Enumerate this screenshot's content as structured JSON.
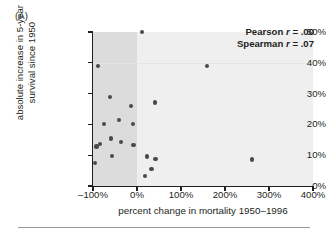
{
  "panel": {
    "label": "(A)"
  },
  "chart_data": {
    "type": "scatter",
    "title": "",
    "xlabel": "percent change in mortality 1950–1996",
    "ylabel": "absolute increase in 5-year survival since 1950",
    "xlim": [
      -100,
      400
    ],
    "ylim": [
      0,
      50
    ],
    "xticks": [
      -100,
      0,
      100,
      200,
      300,
      400
    ],
    "xtick_labels": [
      "–100%",
      "0%",
      "100%",
      "200%",
      "300%",
      "400%"
    ],
    "yticks": [
      0,
      10,
      20,
      30,
      40,
      50
    ],
    "ytick_labels": [
      "0%",
      "10%",
      "20%",
      "30%",
      "40%",
      "50%"
    ],
    "grid": false,
    "legend": "none",
    "shaded_region": {
      "from": -100,
      "to": 0,
      "color": "#dcdcdd"
    },
    "plot_background": "#efeff0",
    "marker_color": "#4a4a4c",
    "points": [
      {
        "x": -88,
        "y": 39.0
      },
      {
        "x": -92,
        "y": 12.8
      },
      {
        "x": -96,
        "y": 7.5
      },
      {
        "x": -85,
        "y": 13.6
      },
      {
        "x": -75,
        "y": 20.2
      },
      {
        "x": -62,
        "y": 29.0
      },
      {
        "x": -60,
        "y": 15.4
      },
      {
        "x": -56,
        "y": 9.8
      },
      {
        "x": -40,
        "y": 21.3
      },
      {
        "x": -36,
        "y": 14.4
      },
      {
        "x": -13,
        "y": 26.1
      },
      {
        "x": -10,
        "y": 20.0
      },
      {
        "x": -8,
        "y": 13.2
      },
      {
        "x": 12,
        "y": 50.0
      },
      {
        "x": 18,
        "y": 3.2
      },
      {
        "x": 22,
        "y": 9.6
      },
      {
        "x": 33,
        "y": 5.5
      },
      {
        "x": 40,
        "y": 27.1
      },
      {
        "x": 42,
        "y": 8.8
      },
      {
        "x": 160,
        "y": 39.0
      },
      {
        "x": 262,
        "y": 8.6
      }
    ],
    "annotations": [
      {
        "name": "pearson",
        "label": "Pearson",
        "symbol": "r",
        "text": " = .00"
      },
      {
        "name": "spearman",
        "label": "Spearman",
        "symbol": "r",
        "text": " = .07"
      }
    ]
  }
}
